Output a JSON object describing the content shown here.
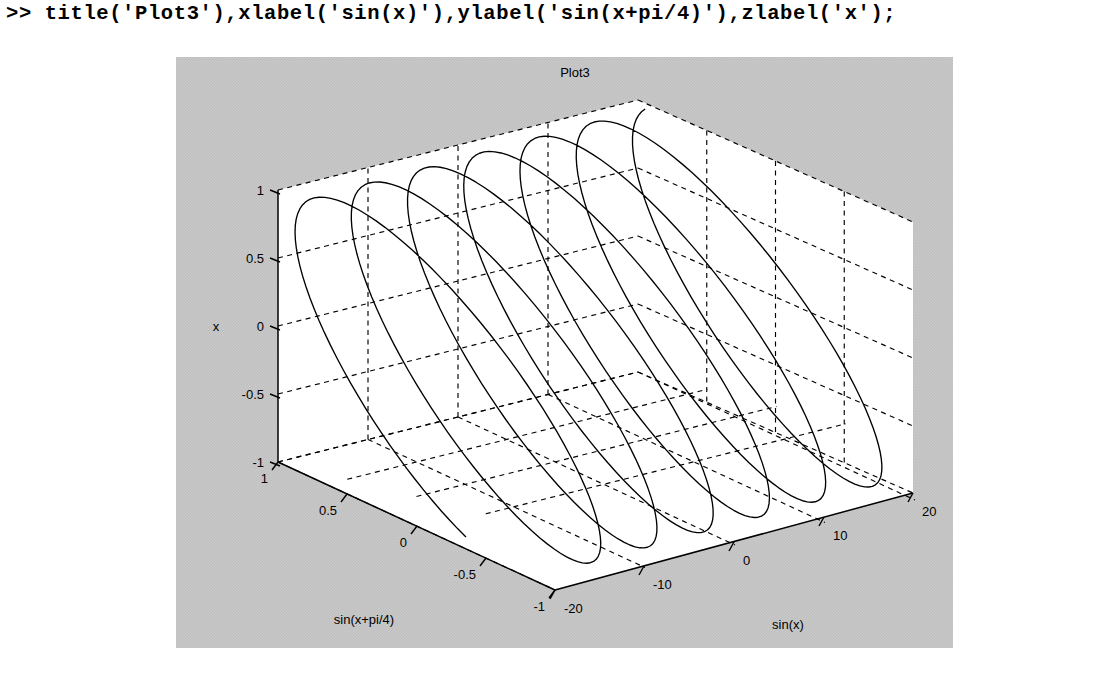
{
  "console": {
    "prompt": ">>",
    "command": ">> title('Plot3'),xlabel('sin(x)'),ylabel('sin(x+pi/4)'),zlabel('x');"
  },
  "figure": {
    "background_color": "#c9c9c9",
    "axes_background_color": "#ffffff",
    "line_color": "#000000",
    "grid_color": "#000000"
  },
  "chart_data": {
    "type": "line",
    "render": "3d-parametric",
    "title": "Plot3",
    "xlabel": "sin(x)",
    "ylabel": "sin(x+pi/4)",
    "zlabel": "x",
    "xlim": [
      -20,
      20
    ],
    "ylim": [
      -1,
      1
    ],
    "zlim": [
      -1,
      1
    ],
    "xticks": [
      -20,
      -10,
      0,
      10,
      20
    ],
    "xticklabels": [
      "-20",
      "-10",
      "0",
      "10",
      "20"
    ],
    "yticks": [
      1,
      0.5,
      0,
      -0.5,
      -1
    ],
    "yticklabels": [
      "1",
      "0.5",
      "0",
      "-0.5",
      "-1"
    ],
    "zticks": [
      1,
      0.5,
      0,
      -0.5,
      -1
    ],
    "zticklabels": [
      "1",
      "0.5",
      "0",
      "-0.5",
      "-1"
    ],
    "grid": true,
    "grid_style": "dashed",
    "legend": null,
    "view": {
      "azimuth": -37.5,
      "elevation": 30
    },
    "series": [
      {
        "name": "plot3(sin(x),sin(x+pi/4),x)",
        "parametric": true,
        "t_range": [
          -20,
          20
        ],
        "t_samples": 600,
        "x_expr": "sin(t)",
        "y_expr": "sin(t+pi/4)",
        "z_expr": "t_normalized",
        "note": "Helical Lissajous curve: 3D parametric trace sweeping from t=-20 to t=20, producing about 6 loops along the sin(x) axis."
      }
    ]
  }
}
